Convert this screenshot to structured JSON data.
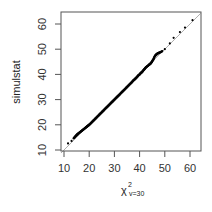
{
  "chart_data": {
    "type": "scatter",
    "title": "",
    "xlabel": "χ²_{v=30}",
    "xlabel_main": "χ",
    "xlabel_sup": "2",
    "xlabel_sub": "v=30",
    "ylabel": "simulstat",
    "xlim": [
      8.5,
      64
    ],
    "ylim": [
      8.5,
      64
    ],
    "xticks": [
      10,
      20,
      30,
      40,
      50,
      60
    ],
    "yticks": [
      10,
      20,
      30,
      40,
      50,
      60
    ],
    "xtick_labels": [
      "10",
      "20",
      "30",
      "40",
      "50",
      "60"
    ],
    "ytick_labels": [
      "10",
      "20",
      "30",
      "40",
      "50",
      "60"
    ],
    "grid": false,
    "legend": null,
    "reference_line": {
      "type": "y=x",
      "color": "#999999"
    },
    "point_color": "#000000",
    "series": [
      {
        "name": "qq-points",
        "x": [
          11.6,
          13.0,
          13.8,
          14.5,
          15.0,
          15.5,
          16.0,
          16.5,
          17.0,
          17.5,
          18.0,
          18.5,
          19.0,
          19.5,
          20.0,
          20.5,
          21.0,
          21.5,
          22.0,
          22.5,
          23.0,
          23.5,
          24.0,
          24.5,
          25.0,
          25.5,
          26.0,
          26.5,
          27.0,
          27.5,
          28.0,
          28.5,
          29.0,
          29.5,
          30.0,
          30.5,
          31.0,
          31.5,
          32.0,
          32.5,
          33.0,
          33.5,
          34.0,
          34.5,
          35.0,
          35.5,
          36.0,
          36.5,
          37.0,
          37.5,
          38.0,
          38.5,
          39.0,
          39.5,
          40.0,
          40.5,
          41.0,
          41.5,
          42.0,
          42.5,
          43.0,
          43.5,
          44.0,
          44.5,
          45.0,
          45.5,
          46.0,
          46.5,
          47.0,
          47.5,
          48.0,
          49.0,
          50.0,
          52.0,
          53.5,
          56.0,
          58.0,
          61.0
        ],
        "y": [
          12.6,
          13.6,
          14.6,
          15.4,
          15.9,
          16.4,
          16.8,
          17.2,
          17.6,
          18.0,
          18.4,
          18.8,
          19.2,
          19.6,
          20.0,
          20.5,
          21.0,
          21.5,
          22.0,
          22.5,
          23.0,
          23.5,
          24.0,
          24.5,
          25.0,
          25.5,
          26.0,
          26.5,
          27.0,
          27.5,
          28.0,
          28.5,
          29.0,
          29.5,
          30.0,
          30.5,
          31.0,
          31.5,
          32.0,
          32.5,
          33.0,
          33.5,
          34.0,
          34.5,
          35.0,
          35.5,
          36.0,
          36.5,
          37.0,
          37.6,
          38.0,
          38.5,
          39.0,
          39.6,
          40.0,
          40.6,
          41.0,
          41.6,
          42.2,
          42.8,
          43.2,
          43.6,
          44.0,
          44.5,
          45.2,
          46.0,
          47.2,
          47.8,
          48.2,
          48.5,
          48.7,
          49.2,
          50.0,
          52.3,
          54.5,
          56.8,
          58.6,
          61.5
        ]
      }
    ]
  }
}
